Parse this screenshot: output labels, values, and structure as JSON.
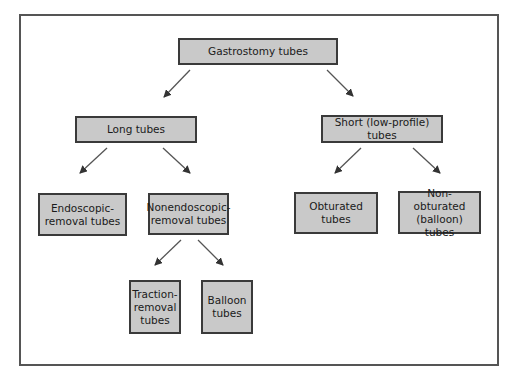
{
  "diagram": {
    "type": "tree",
    "colors": {
      "box_fill": "#c9c9c9",
      "box_border": "#3a3a3a",
      "frame": "#555555",
      "arrow": "#444444"
    },
    "nodes": {
      "root": {
        "label": "Gastrostomy tubes"
      },
      "long": {
        "label": "Long tubes"
      },
      "short": {
        "label": "Short (low-profile) tubes"
      },
      "endoscopic": {
        "label": "Endoscopic-removal tubes"
      },
      "nonendoscopic": {
        "label": "Nonendoscopic-removal tubes"
      },
      "obturated": {
        "label": "Obturated tubes"
      },
      "nonobturated": {
        "label": "Non-obturated (balloon) tubes"
      },
      "traction": {
        "label": "Traction-removal tubes"
      },
      "balloon": {
        "label": "Balloon tubes"
      }
    },
    "edges": [
      [
        "root",
        "long"
      ],
      [
        "root",
        "short"
      ],
      [
        "long",
        "endoscopic"
      ],
      [
        "long",
        "nonendoscopic"
      ],
      [
        "short",
        "obturated"
      ],
      [
        "short",
        "nonobturated"
      ],
      [
        "nonendoscopic",
        "traction"
      ],
      [
        "nonendoscopic",
        "balloon"
      ]
    ]
  }
}
